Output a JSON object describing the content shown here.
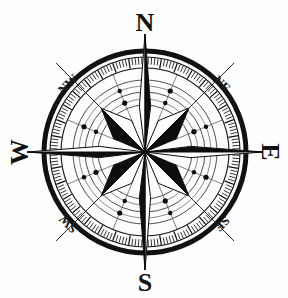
{
  "figure": {
    "type": "compass-rose",
    "background_color": "#fdfdfd",
    "ink_color": "#111111",
    "width": 288,
    "height": 298
  },
  "geometry": {
    "center_x": 145,
    "center_y": 152,
    "outer_circle_radius": 101,
    "outer_circle_stroke": 5,
    "tick_ring_outer_radius": 95,
    "tick_ring_inner_radius": 84,
    "ring_radii": [
      95,
      84,
      72,
      60,
      47
    ],
    "dot_ring_radii": [
      66,
      53
    ],
    "spike_tip_radius": 124,
    "diagonal_line_tip_radius": 126,
    "star_major_point_radius": 118,
    "star_minor_point_radius": 62,
    "tick_count": 180
  },
  "labels": {
    "cardinal": [
      {
        "name": "north",
        "text": "N",
        "angle_deg": 0,
        "rotation_deg": 0,
        "x": 145,
        "y": 25,
        "font_size": 26
      },
      {
        "name": "east",
        "text": "E",
        "angle_deg": 90,
        "rotation_deg": 90,
        "x": 268,
        "y": 152,
        "font_size": 26
      },
      {
        "name": "south",
        "text": "S",
        "angle_deg": 180,
        "rotation_deg": 0,
        "x": 145,
        "y": 285,
        "font_size": 26
      },
      {
        "name": "west",
        "text": "W",
        "angle_deg": 270,
        "rotation_deg": -90,
        "x": 22,
        "y": 152,
        "font_size": 26
      }
    ],
    "ordinal": [
      {
        "name": "northwest",
        "text": "NW",
        "angle_deg": 315,
        "rotation_deg": -45,
        "x": 69,
        "y": 85,
        "font_size": 13
      },
      {
        "name": "northeast",
        "text": "NE",
        "angle_deg": 45,
        "rotation_deg": 45,
        "x": 221,
        "y": 85,
        "font_size": 13
      },
      {
        "name": "southeast",
        "text": "SE",
        "angle_deg": 135,
        "rotation_deg": 135,
        "x": 221,
        "y": 223,
        "font_size": 13
      },
      {
        "name": "southwest",
        "text": "SW",
        "angle_deg": 225,
        "rotation_deg": 225,
        "x": 69,
        "y": 223,
        "font_size": 13
      }
    ]
  },
  "star": {
    "points": 8,
    "major_directions": [
      "N",
      "E",
      "S",
      "W"
    ],
    "minor_directions": [
      "NE",
      "SE",
      "SW",
      "NW"
    ],
    "shading": "split-half dark and light per point",
    "dark_color": "#0d0d0d",
    "light_color": "#ffffff",
    "outline_color": "#0d0d0d"
  },
  "dots": {
    "count": 8,
    "color": "#0d0d0d",
    "radius_px": 2.6,
    "angles_deg": [
      22.5,
      67.5,
      112.5,
      157.5,
      202.5,
      247.5,
      292.5,
      337.5
    ]
  },
  "radial_lines": {
    "count": 16,
    "step_deg": 22.5,
    "color": "#4a4a4a"
  }
}
